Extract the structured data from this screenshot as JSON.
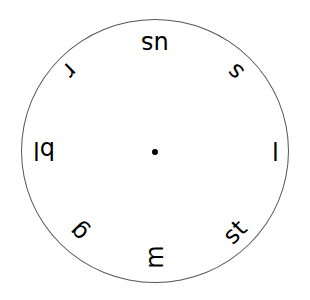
{
  "diagram": {
    "type": "phonics-spinner-wheel",
    "circle": {
      "stroke": "#555555",
      "fill": "#ffffff"
    },
    "center_dot": {
      "color": "#000000"
    },
    "labels": [
      {
        "text": "us",
        "position": "top",
        "x": 155,
        "y": 44,
        "rotate": 180
      },
      {
        "text": "s",
        "position": "top-right",
        "x": 235,
        "y": 72,
        "rotate": 225
      },
      {
        "text": "l",
        "position": "right",
        "x": 275,
        "y": 150,
        "rotate": 180
      },
      {
        "text": "st",
        "position": "bottom-right",
        "x": 235,
        "y": 232,
        "rotate": 315
      },
      {
        "text": "m",
        "position": "bottom",
        "x": 154,
        "y": 257,
        "rotate": 270
      },
      {
        "text": "g",
        "position": "bottom-left",
        "x": 78,
        "y": 232,
        "rotate": 225
      },
      {
        "text": "bl",
        "position": "left",
        "x": 44,
        "y": 150,
        "rotate": 180
      },
      {
        "text": "r",
        "position": "top-left",
        "x": 70,
        "y": 71,
        "rotate": 135
      }
    ]
  }
}
